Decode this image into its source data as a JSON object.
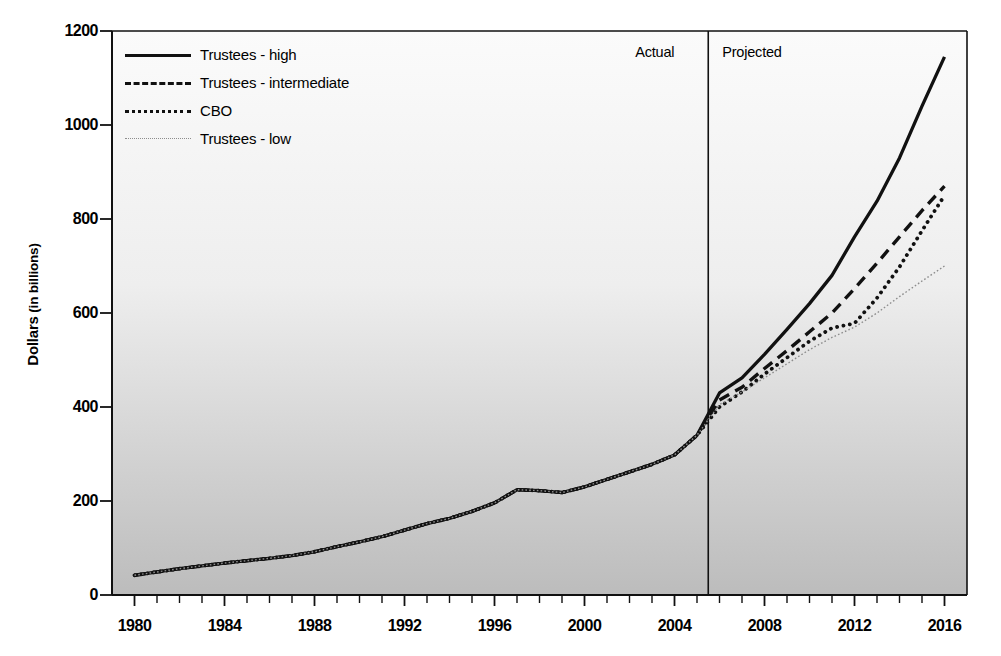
{
  "chart_data": {
    "type": "line",
    "title": "",
    "xlabel": "",
    "ylabel": "Dollars (in billions)",
    "ylabel_bold_part": "Dollars",
    "ylabel_rest": " (in billions)",
    "xlim": [
      1979,
      2017
    ],
    "ylim": [
      0,
      1200
    ],
    "yticks": [
      0,
      200,
      400,
      600,
      800,
      1000,
      1200
    ],
    "xticks": [
      1980,
      1984,
      1988,
      1992,
      1996,
      2000,
      2004,
      2008,
      2012,
      2016
    ],
    "xtick_minor_step": 1,
    "grid": false,
    "legend_position": "top-left",
    "annotations": [
      {
        "text": "Actual",
        "x": 2004.6,
        "align": "right"
      },
      {
        "text": "Projected",
        "x": 2006.0,
        "align": "left"
      }
    ],
    "divider": {
      "x": 2005.5,
      "label_left": "Actual",
      "label_right": "Projected"
    },
    "x": [
      1980,
      1981,
      1982,
      1983,
      1984,
      1985,
      1986,
      1987,
      1988,
      1989,
      1990,
      1991,
      1992,
      1993,
      1994,
      1995,
      1996,
      1997,
      1998,
      1999,
      2000,
      2001,
      2002,
      2003,
      2004,
      2005,
      2006,
      2007,
      2008,
      2009,
      2010,
      2011,
      2012,
      2013,
      2014,
      2015,
      2016
    ],
    "series": [
      {
        "name": "Trustees - high",
        "style": "solid",
        "color": "#111111",
        "values": [
          42,
          49,
          56,
          62,
          68,
          73,
          78,
          84,
          92,
          103,
          113,
          124,
          138,
          152,
          163,
          178,
          196,
          224,
          222,
          218,
          230,
          246,
          262,
          278,
          298,
          340,
          430,
          462,
          512,
          565,
          620,
          680,
          762,
          838,
          930,
          1040,
          1145
        ]
      },
      {
        "name": "Trustees - intermediate",
        "style": "dashed",
        "color": "#111111",
        "values": [
          42,
          49,
          56,
          62,
          68,
          73,
          78,
          84,
          92,
          103,
          113,
          124,
          138,
          152,
          163,
          178,
          196,
          224,
          222,
          218,
          230,
          246,
          262,
          278,
          298,
          340,
          415,
          442,
          482,
          520,
          560,
          600,
          652,
          706,
          762,
          818,
          870
        ]
      },
      {
        "name": "CBO",
        "style": "dotted",
        "color": "#111111",
        "values": [
          42,
          49,
          56,
          62,
          68,
          73,
          78,
          84,
          92,
          103,
          113,
          124,
          138,
          152,
          163,
          178,
          196,
          224,
          222,
          218,
          230,
          246,
          262,
          278,
          298,
          340,
          400,
          432,
          470,
          505,
          540,
          568,
          578,
          632,
          698,
          775,
          850
        ]
      },
      {
        "name": "Trustees - low",
        "style": "fine-dotted",
        "color": "#8d8d8d",
        "values": [
          42,
          49,
          56,
          62,
          68,
          73,
          78,
          84,
          92,
          103,
          113,
          124,
          138,
          152,
          163,
          178,
          196,
          224,
          222,
          218,
          230,
          246,
          262,
          278,
          298,
          340,
          405,
          432,
          462,
          492,
          522,
          548,
          570,
          600,
          635,
          668,
          700
        ]
      }
    ]
  },
  "legend": {
    "items": [
      {
        "label": "Trustees - high",
        "style": "solid"
      },
      {
        "label": "Trustees - intermediate",
        "style": "dashed"
      },
      {
        "label": "CBO",
        "style": "dotted"
      },
      {
        "label": "Trustees - low",
        "style": "fine-dotted"
      }
    ]
  }
}
